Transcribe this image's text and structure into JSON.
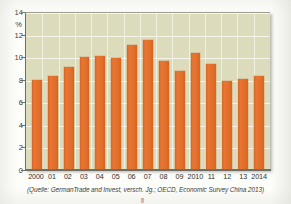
{
  "chart_data": {
    "type": "bar",
    "title": "",
    "subtitle": "",
    "xlabel": "",
    "ylabel": "%",
    "ylim": [
      0,
      14
    ],
    "yticks": [
      0,
      2,
      4,
      6,
      8,
      10,
      12,
      14
    ],
    "ytick_labels": [
      "0",
      "2",
      "4",
      "6",
      "8",
      "10",
      "12",
      "14"
    ],
    "grid": true,
    "legend": "none",
    "unit": "%",
    "categories": [
      "2000",
      "01",
      "02",
      "03",
      "04",
      "05",
      "06",
      "07",
      "08",
      "09",
      "2010",
      "11",
      "12",
      "13",
      "2014"
    ],
    "values": [
      8.0,
      8.3,
      9.1,
      10.0,
      10.1,
      9.9,
      11.1,
      11.5,
      9.7,
      8.8,
      10.4,
      9.4,
      7.9,
      8.1,
      8.3
    ],
    "series": [
      {
        "name": "",
        "color": "#e2702e",
        "values": [
          8.0,
          8.3,
          9.1,
          10.0,
          10.1,
          9.9,
          11.1,
          11.5,
          9.7,
          8.8,
          10.4,
          9.4,
          7.9,
          8.1,
          8.3
        ]
      }
    ],
    "source_note": "(Quelle: GermanTrade and Invest, versch. Jg.; OECD, Economic Survey China 2013)"
  },
  "figure": {
    "source_caption": "(Quelle: GermanTrade and Invest, versch. Jg.; OECD, Economic Survey China 2013)"
  },
  "colors": {
    "bar": "#e2702e",
    "plot_background": "#dcdcbc",
    "gridline": "#fffff8",
    "axis": "#6e6e63",
    "text": "#2e2e2e",
    "page_background": "#fdfdfa"
  }
}
